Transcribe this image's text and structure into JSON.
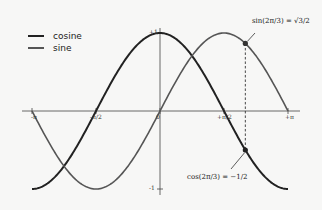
{
  "chart_data": {
    "type": "line",
    "title": "",
    "xlabel": "",
    "ylabel": "",
    "xlim": [
      -3.14159,
      3.14159
    ],
    "ylim": [
      -1,
      1
    ],
    "grid": false,
    "legend_position": "upper left",
    "x_ticks": [
      "-π",
      "-π/2",
      "0",
      "+π/2",
      "+π"
    ],
    "y_ticks": [
      "-1",
      "+1"
    ],
    "series": [
      {
        "name": "cosine",
        "function": "cos(x)",
        "color": "#222222",
        "linewidth": 2
      },
      {
        "name": "sine",
        "function": "sin(x)",
        "color": "#555555",
        "linewidth": 1.6
      }
    ],
    "annotations": [
      {
        "text": "sin(2π/3) = √3/2",
        "x": 2.0944,
        "y": 0.866,
        "marker": "dot"
      },
      {
        "text": "cos(2π/3) = -1/2",
        "x": 2.0944,
        "y": -0.5,
        "marker": "dot"
      }
    ],
    "vertical_dashed_line_x": 2.0944
  },
  "legend": {
    "items": [
      {
        "label": "cosine"
      },
      {
        "label": "sine"
      }
    ]
  },
  "ticks": {
    "x": [
      "-π",
      "-π/2",
      "0",
      "+π/2",
      "+π"
    ],
    "y_top": "+1",
    "y_bottom": "-1"
  },
  "annotations": {
    "sin_label": "sin(2π/3) = √3/2",
    "cos_label": "cos(2π/3) = −1/2"
  }
}
